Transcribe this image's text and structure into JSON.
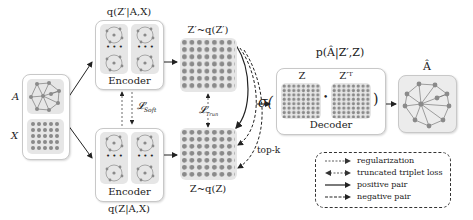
{
  "input": {
    "a_label": "A",
    "x_label": "X"
  },
  "encoder_top": {
    "title": "q(Z′|A,X)",
    "label": "Encoder",
    "dots": "• • •"
  },
  "encoder_bottom": {
    "title": "q(Z|A,X)",
    "label": "Encoder",
    "dots": "• • •"
  },
  "loss_soft": "𝓛",
  "loss_soft_sub": "Soft",
  "loss_trun": "𝓛",
  "loss_trun_sub": "Trun",
  "latent_top": {
    "label": "Z′~q(Z′)"
  },
  "latent_bottom": {
    "label": "Z~q(Z)"
  },
  "topk_label": "top-k",
  "decoder": {
    "title": "p(Â|Z′,Z)",
    "sigma": "σ(",
    "close_paren": ")",
    "z_label": "Z",
    "zt_label": "Z′ᵀ",
    "dot": "•",
    "label": "Decoder"
  },
  "output": {
    "label": "Â"
  },
  "legend": {
    "items": [
      {
        "label": "regularization",
        "style": "dashed-single"
      },
      {
        "label": "truncated triplet loss",
        "style": "dashed-double"
      },
      {
        "label": "positive pair",
        "style": "solid"
      },
      {
        "label": "negative pair",
        "style": "dashed"
      }
    ]
  },
  "colors": {
    "node": "#8a8a8a",
    "tile_bg": "#e6e6e6",
    "edge": "#555555",
    "panel_border": "#c8c8c8"
  }
}
